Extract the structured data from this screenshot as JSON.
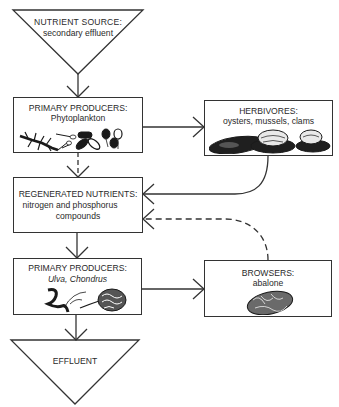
{
  "diagram": {
    "nodes": {
      "nutrient_source": {
        "title": "NUTRIENT SOURCE:",
        "subtitle": "secondary effluent",
        "shape": "triangle"
      },
      "primary_producers_1": {
        "title": "PRIMARY PRODUCERS:",
        "subtitle": "Phytoplankton",
        "illustration": "phytoplankton"
      },
      "herbivores": {
        "title": "HERBIVORES:",
        "subtitle": "oysters, mussels, clams",
        "illustration": "shellfish"
      },
      "regenerated_nutrients": {
        "title": "REGENERATED NUTRIENTS:",
        "subtitle_line1": "nitrogen and phosphorus",
        "subtitle_line2": "compounds"
      },
      "primary_producers_2": {
        "title": "PRIMARY PRODUCERS:",
        "subtitle": "Ulva, Chondrus",
        "illustration": "seaweed"
      },
      "browsers": {
        "title": "BROWSERS:",
        "subtitle": "abalone",
        "illustration": "abalone"
      },
      "effluent": {
        "title": "EFFLUENT",
        "shape": "triangle"
      }
    },
    "edges": [
      {
        "from": "nutrient_source",
        "to": "primary_producers_1",
        "style": "solid"
      },
      {
        "from": "primary_producers_1",
        "to": "herbivores",
        "style": "solid"
      },
      {
        "from": "primary_producers_1",
        "to": "regenerated_nutrients",
        "style": "dashed"
      },
      {
        "from": "herbivores",
        "to": "regenerated_nutrients",
        "style": "solid"
      },
      {
        "from": "browsers",
        "to": "regenerated_nutrients",
        "style": "dashed"
      },
      {
        "from": "regenerated_nutrients",
        "to": "primary_producers_2",
        "style": "solid"
      },
      {
        "from": "primary_producers_2",
        "to": "browsers",
        "style": "solid"
      },
      {
        "from": "primary_producers_2",
        "to": "effluent",
        "style": "solid"
      }
    ]
  }
}
